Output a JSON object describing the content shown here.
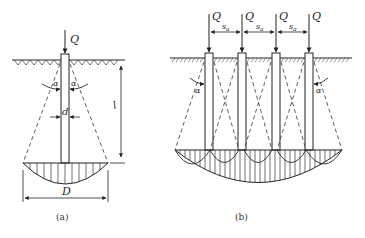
{
  "figure_a": {
    "load_label": "Q",
    "angle_label_left": "α",
    "angle_label_right": "α",
    "diameter_label": "d",
    "length_label": "l",
    "bulb_width_label": "D",
    "caption": "(a)"
  },
  "figure_b": {
    "load_labels": [
      "Q",
      "Q",
      "Q",
      "Q"
    ],
    "spacing_labels": [
      "s_a",
      "s_a",
      "s_a"
    ],
    "spacing_symbol": "s",
    "spacing_subscript": "a",
    "angle_label_left": "α",
    "angle_label_right": "α",
    "caption": "(b)"
  },
  "colors": {
    "line": "#222222",
    "background": "#ffffff"
  }
}
